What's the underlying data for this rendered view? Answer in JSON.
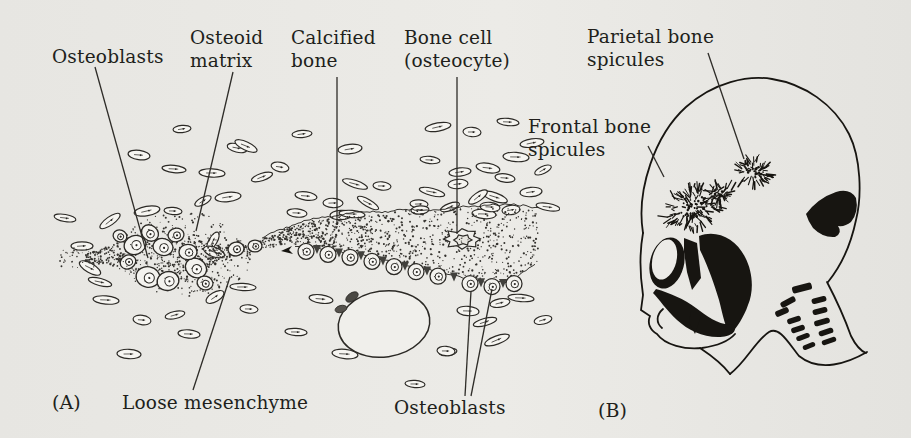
{
  "figure": {
    "colors": {
      "paper": "#e9e8e4",
      "cell_fill": "#f3f2ee",
      "ink": "#2b2925",
      "leader": "#2e2c28",
      "black": "#171511",
      "stipple": "#34322e"
    }
  },
  "panel_a": {
    "letter": "(A)",
    "labels": {
      "osteoblasts_top": "Osteoblasts",
      "osteoid_matrix": "Osteoid\nmatrix",
      "calcified_bone": "Calcified\nbone",
      "bone_cell": "Bone cell\n(osteocyte)",
      "loose_mesenchyme": "Loose mesenchyme",
      "osteoblasts_bottom": "Osteoblasts"
    }
  },
  "panel_b": {
    "letter": "(B)",
    "labels": {
      "parietal_bone_spicules": "Parietal bone\nspicules",
      "frontal_bone_spicules": "Frontal bone\nspicules"
    }
  }
}
